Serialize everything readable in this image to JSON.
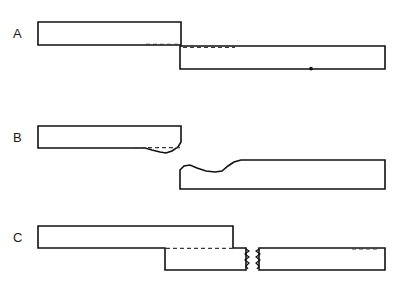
{
  "figure": {
    "title": "",
    "background_color": "#ffffff",
    "line_color": "#111111",
    "dashed_color": "#3a3a3a",
    "width": 394,
    "height": 286,
    "panels": [
      {
        "id": "A",
        "label": "A",
        "label_x": 13,
        "label_y": 27,
        "description": "Two straight rectangular bars overlapping in a lap joint, upper bar on the left, lower bar on the right, contact interface shown as a faint line",
        "upper_bar": {
          "x": 38,
          "y": 22,
          "width": 143,
          "height": 22
        },
        "lower_bar": {
          "x": 180,
          "y": 46,
          "width": 205,
          "height": 23
        },
        "marks": [
          "interface-line",
          "dot-mark"
        ]
      },
      {
        "id": "B",
        "label": "B",
        "label_x": 13,
        "label_y": 131,
        "description": "Same two bars after shear deformation; the overlapped ends are necked and drawn into an S shaped offset, original outline shown dashed",
        "upper_bar": {
          "x": 38,
          "y": 126,
          "width": 143,
          "height": 22
        },
        "lower_bar": {
          "x": 180,
          "y": 166,
          "width": 205,
          "height": 23
        },
        "marks": [
          "dashed-original-outline",
          "necked-profile"
        ]
      },
      {
        "id": "C",
        "label": "C",
        "label_x": 13,
        "label_y": 231,
        "description": "Final separation; the left piece is stepped downward forming an L profile and the right piece has broken free, both showing jagged fracture surfaces",
        "upper_bar": {
          "x": 38,
          "y": 226,
          "width": 143,
          "height": 22
        },
        "step_block": {
          "x": 165,
          "y": 248,
          "width": 84,
          "height": 22
        },
        "lower_bar": {
          "x": 259,
          "y": 248,
          "width": 126,
          "height": 22
        },
        "marks": [
          "dashed-original-outline",
          "jagged-fracture-left",
          "jagged-fracture-right"
        ]
      }
    ]
  }
}
